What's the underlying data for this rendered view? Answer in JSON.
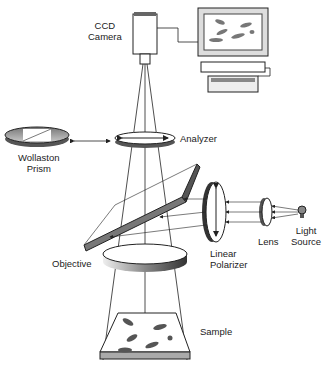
{
  "diagram": {
    "title": "",
    "labels": {
      "ccd_line1": "CCD",
      "ccd_line2": "Camera",
      "analyzer": "Analyzer",
      "wollaston_line1": "Wollaston",
      "wollaston_line2": "Prism",
      "objective": "Objective",
      "linear_line1": "Linear",
      "linear_line2": "Polarizer",
      "lens": "Lens",
      "light_line1": "Light",
      "light_line2": "Source",
      "sample": "Sample"
    },
    "components": [
      "CCD Camera",
      "Computer",
      "Analyzer",
      "Wollaston Prism",
      "Beam Splitter",
      "Objective",
      "Linear Polarizer",
      "Lens",
      "Light Source",
      "Sample"
    ],
    "colors": {
      "line": "#222222",
      "fill_dark": "#555555",
      "fill_light": "#e8e8e8"
    }
  }
}
